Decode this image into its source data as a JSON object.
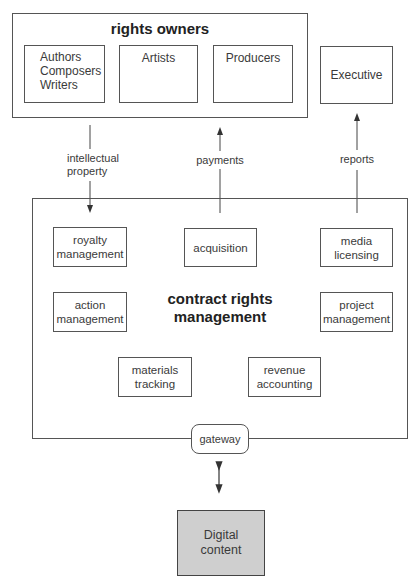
{
  "rights_owners": {
    "title": "rights owners",
    "members": [
      {
        "label": "Authors\nComposers\nWriters"
      },
      {
        "label": "Artists"
      },
      {
        "label": "Producers"
      }
    ]
  },
  "executive": {
    "label": "Executive"
  },
  "flows": {
    "intellectual_property": "intellectual property",
    "payments": "payments",
    "reports": "reports"
  },
  "crm": {
    "title": "contract rights management",
    "modules": [
      {
        "label": "royalty management"
      },
      {
        "label": "acquisition"
      },
      {
        "label": "media licensing"
      },
      {
        "label": "action management"
      },
      {
        "label": "project management"
      },
      {
        "label": "materials tracking"
      },
      {
        "label": "revenue accounting"
      }
    ]
  },
  "gateway": {
    "label": "gateway"
  },
  "digital_content": {
    "label": "Digital content",
    "fill": "#cfcfcf"
  }
}
